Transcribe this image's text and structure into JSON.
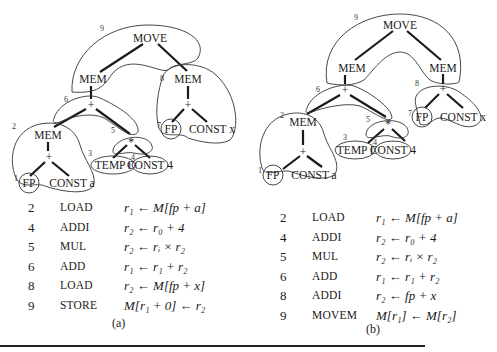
{
  "tree_a": {
    "nodes": {
      "move": "MOVE",
      "mem_l": "MEM",
      "mem_r": "MEM",
      "plus_r": "+",
      "fp_r": "FP",
      "const_x": "CONST x",
      "plus_mid": "+",
      "mem2": "MEM",
      "plus2": "+",
      "fp1": "FP",
      "const_a": "CONST a",
      "star": "*",
      "temp_i": "TEMP i",
      "const4": "CONST 4"
    },
    "tile_numbers": {
      "t9": "9",
      "t8": "8",
      "t7": "7",
      "t6": "6",
      "t5": "5",
      "t4": "4",
      "t3": "3",
      "t2": "2",
      "t1": "1"
    },
    "instructions": [
      {
        "num": "2",
        "op": "LOAD",
        "expr": "r₁ ← M[fp + a]"
      },
      {
        "num": "4",
        "op": "ADDI",
        "expr": "r₂ ← r₀ + 4"
      },
      {
        "num": "5",
        "op": "MUL",
        "expr": "r₂ ← rᵢ × r₂"
      },
      {
        "num": "6",
        "op": "ADD",
        "expr": "r₁ ← r₁ + r₂"
      },
      {
        "num": "8",
        "op": "LOAD",
        "expr": "r₂ ← M[fp + x]"
      },
      {
        "num": "9",
        "op": "STORE",
        "expr": "M[r₁ + 0] ← r₂"
      }
    ],
    "caption": "(a)"
  },
  "tree_b": {
    "nodes": {
      "move": "MOVE",
      "mem_l": "MEM",
      "mem_r": "MEM",
      "plus_r": "+",
      "fp_r": "FP",
      "const_x": "CONST x",
      "plus_mid": "+",
      "mem2": "MEM",
      "plus2": "+",
      "fp1": "FP",
      "const_a": "CONST a",
      "star": "*",
      "temp_i": "TEMP i",
      "const4": "CONST 4"
    },
    "tile_numbers": {
      "t9": "9",
      "t8": "8",
      "t7": "7",
      "t6": "6",
      "t5": "5",
      "t4": "4",
      "t3": "3",
      "t2": "2",
      "t1": "1"
    },
    "instructions": [
      {
        "num": "2",
        "op": "LOAD",
        "expr": "r₁ ← M[fp + a]"
      },
      {
        "num": "4",
        "op": "ADDI",
        "expr": "r₂ ← r₀ + 4"
      },
      {
        "num": "5",
        "op": "MUL",
        "expr": "r₂ ← rᵢ × r₂"
      },
      {
        "num": "6",
        "op": "ADD",
        "expr": "r₁ ← r₁ + r₂"
      },
      {
        "num": "8",
        "op": "ADDI",
        "expr": "r₂ ← fp + x"
      },
      {
        "num": "9",
        "op": "MOVEM",
        "expr": "M[r₁] ← M[r₂]"
      }
    ],
    "caption": "(b)"
  }
}
